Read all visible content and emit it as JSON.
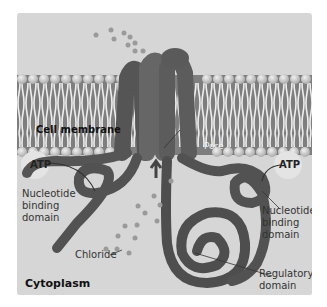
{
  "figure": {
    "labels": {
      "cell_membrane": "Cell membrane",
      "pore": "Pore",
      "atp_left": "ATP",
      "atp_right": "ATP",
      "nbd_left": [
        "Nucleotide",
        "binding",
        "domain"
      ],
      "nbd_right": [
        "Nucleotide",
        "binding",
        "domain"
      ],
      "chloride": "Chloride",
      "regulatory": [
        "Regulatory",
        "domain"
      ],
      "cytoplasm": "Cytoplasm"
    },
    "colors": {
      "background": "#d6d6d6",
      "membrane_heads": "#bdbdbd",
      "membrane_tails": "#8a8a8a",
      "protein": "#5a5a5a",
      "ions": "#9a9a9a"
    }
  }
}
